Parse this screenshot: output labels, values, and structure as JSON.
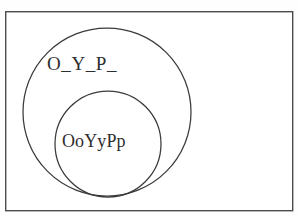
{
  "diagram": {
    "type": "nested-set-circles",
    "background_color": "#fefefe",
    "frame": {
      "name": "universe-frame",
      "stroke_color": "#4c4c4c",
      "x": 5,
      "y": 11,
      "width": 288,
      "height": 200
    },
    "outer_set": {
      "label": "O_Y_P_",
      "stroke_color": "#3a3a3a",
      "cx": 107,
      "cy": 112,
      "r": 84
    },
    "inner_set": {
      "label": "OoYyPp",
      "stroke_color": "#3a3a3a",
      "cx": 108,
      "cy": 144,
      "r": 53
    }
  }
}
